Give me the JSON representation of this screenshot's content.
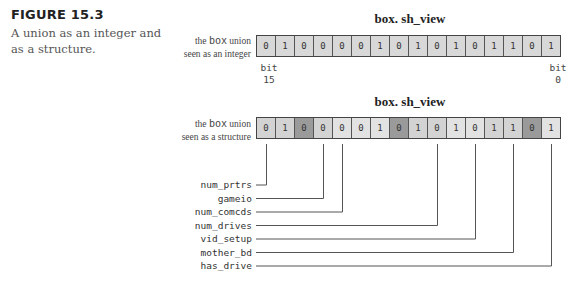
{
  "caption": {
    "figure_number": "FIGURE 15.3",
    "text_line1": "A union as an integer and",
    "text_line2": "as a structure."
  },
  "integer_view": {
    "title": "box. sh_view",
    "label_line1_pre": "the ",
    "label_line1_mono": "box",
    "label_line1_post": " union",
    "label_line2": "seen as an integer",
    "bits": [
      "0",
      "1",
      "0",
      "0",
      "0",
      "0",
      "1",
      "0",
      "1",
      "0",
      "1",
      "0",
      "1",
      "1",
      "0",
      "1"
    ],
    "msb_label": "bit",
    "msb_index": "15",
    "lsb_label": "bit",
    "lsb_index": "0"
  },
  "structure_view": {
    "title": "box. sh_view",
    "label_line1_pre": "the ",
    "label_line1_mono": "box",
    "label_line1_post": " union",
    "label_line2": "seen as a structure",
    "bits": [
      "0",
      "1",
      "0",
      "0",
      "0",
      "0",
      "1",
      "0",
      "1",
      "0",
      "1",
      "0",
      "1",
      "1",
      "0",
      "1"
    ],
    "shading": [
      "l1",
      "l1",
      "dark",
      "l1",
      "l2",
      "l2",
      "l2",
      "dark",
      "l1",
      "l1",
      "l2",
      "l2",
      "l1",
      "l1",
      "dark",
      "l2"
    ],
    "fields": [
      {
        "name": "num_prtrs",
        "bit_cell": 0
      },
      {
        "name": "gameio",
        "bit_cell": 3
      },
      {
        "name": "num_comcds",
        "bit_cell": 4
      },
      {
        "name": "num_drives",
        "bit_cell": 9
      },
      {
        "name": "vid_setup",
        "bit_cell": 11
      },
      {
        "name": "mother_bd",
        "bit_cell": 13
      },
      {
        "name": "has_drive",
        "bit_cell": 15
      }
    ]
  }
}
